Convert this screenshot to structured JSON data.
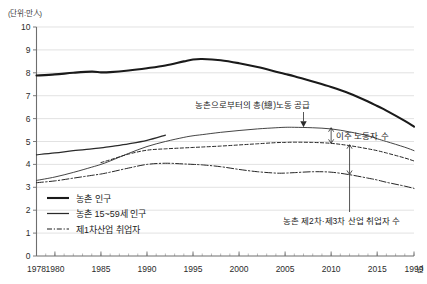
{
  "chart_data": {
    "type": "line",
    "title": "",
    "subtitle": "",
    "unit_label": "(단위:만人)",
    "xlabel": "",
    "ylabel": "",
    "xlim": [
      1978,
      2019
    ],
    "ylim": [
      0,
      10
    ],
    "y_ticks": [
      "0",
      "1",
      "2",
      "3",
      "4",
      "5",
      "6",
      "7",
      "8",
      "9",
      "10"
    ],
    "x_ticks": [
      "1978",
      "1980",
      "1985",
      "1990",
      "1995",
      "2000",
      "2005",
      "2010",
      "2015",
      "1999"
    ],
    "x_tick_values": [
      1978,
      1980,
      1985,
      1990,
      1995,
      2000,
      2005,
      2010,
      2015,
      2019
    ],
    "x_axis_suffix": "년",
    "grid": "horizontal",
    "legend_position": "bottom-left",
    "x": [
      1978,
      1980,
      1982,
      1984,
      1985,
      1986,
      1988,
      1990,
      1992,
      1994,
      1995,
      1996,
      1998,
      2000,
      2002,
      2004,
      2005,
      2006,
      2008,
      2010,
      2012,
      2014,
      2015,
      2016,
      2018,
      2019
    ],
    "series": [
      {
        "name": "농촌 인구",
        "style": "thick-solid",
        "values": [
          7.88,
          7.93,
          8.0,
          8.05,
          8.02,
          8.03,
          8.1,
          8.2,
          8.32,
          8.5,
          8.58,
          8.6,
          8.55,
          8.42,
          8.25,
          8.05,
          7.95,
          7.85,
          7.62,
          7.38,
          7.1,
          6.75,
          6.55,
          6.35,
          5.9,
          5.65
        ]
      },
      {
        "name": "농촌 15~59세 인구",
        "style": "thin-solid-short",
        "values": [
          4.42,
          4.5,
          4.6,
          4.68,
          4.72,
          4.78,
          4.9,
          5.05,
          5.28,
          null,
          null,
          null,
          null,
          null,
          null,
          null,
          null,
          null,
          null,
          null,
          null,
          null,
          null,
          null,
          null,
          null
        ]
      },
      {
        "name": "농촌으로부터의 총(總)노동 공급",
        "style": "thin-solid-long",
        "values": [
          3.3,
          3.45,
          3.65,
          3.88,
          4.0,
          4.15,
          4.48,
          4.78,
          5.0,
          5.18,
          5.25,
          5.3,
          5.4,
          5.48,
          5.55,
          5.6,
          5.62,
          5.62,
          5.6,
          5.55,
          5.42,
          5.25,
          5.12,
          5.0,
          4.75,
          4.6
        ]
      },
      {
        "name": "제1차산업 취업자",
        "style": "dash-dot",
        "values": [
          3.2,
          3.28,
          3.4,
          3.52,
          3.58,
          3.66,
          3.84,
          4.0,
          4.05,
          4.02,
          4.0,
          3.98,
          3.9,
          3.78,
          3.68,
          3.62,
          3.62,
          3.64,
          3.68,
          3.66,
          3.55,
          3.4,
          3.32,
          3.22,
          3.05,
          2.95
        ]
      },
      {
        "name": "농촌 제2차·제3차 산업 취업자 수",
        "style": "dashed",
        "values": [
          null,
          null,
          null,
          null,
          4.08,
          4.2,
          4.45,
          4.62,
          4.68,
          4.72,
          4.74,
          4.76,
          4.8,
          4.85,
          4.9,
          4.95,
          4.96,
          4.97,
          4.96,
          4.92,
          4.82,
          4.68,
          4.6,
          4.5,
          4.28,
          4.15
        ]
      }
    ],
    "annotations": [
      {
        "name": "total-labour-supply",
        "text": "농촌으로부터의 총(總)노동 공급",
        "target_x": 2007,
        "target_y": 5.62
      },
      {
        "name": "migrant-workers",
        "text": "이주 노동자 수",
        "target_x": 2011,
        "target_y": 4.8
      },
      {
        "name": "rural-secondary-tertiary-workers",
        "text": "농촌 제2차·제3차 산업 취업자 수",
        "target_x": 2013,
        "target_y": 4.0
      }
    ],
    "legend": [
      {
        "label": "농촌 인구",
        "style": "thick-solid"
      },
      {
        "label": "농촌 15~59세 인구",
        "style": "thin-solid"
      },
      {
        "label": "제1차산업 취업자",
        "style": "dash-dot"
      }
    ]
  }
}
